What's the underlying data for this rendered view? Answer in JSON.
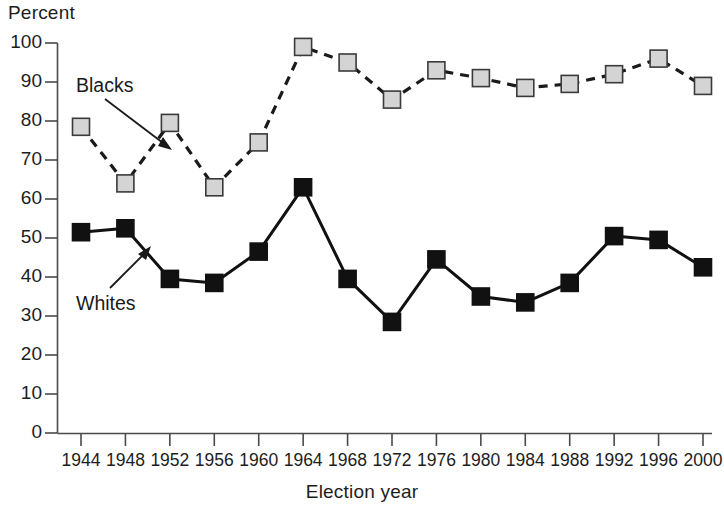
{
  "chart_data": {
    "type": "line",
    "title": "",
    "xlabel": "Election year",
    "ylabel": "Percent",
    "ylim": [
      0,
      100
    ],
    "y_ticks": [
      0,
      10,
      20,
      30,
      40,
      50,
      60,
      70,
      80,
      90,
      100
    ],
    "grid": false,
    "legend_position": "inline-annotations",
    "categories": [
      1944,
      1948,
      1952,
      1956,
      1960,
      1964,
      1968,
      1972,
      1976,
      1980,
      1984,
      1988,
      1992,
      1996,
      2000
    ],
    "x_tick_labels": [
      "1944",
      "1948",
      "1952",
      "1956",
      "1960",
      "1964",
      "1968",
      "1972",
      "1976",
      "1980",
      "1984",
      "1988",
      "1992",
      "1996",
      "2000"
    ],
    "series": [
      {
        "name": "Blacks",
        "marker": "square",
        "marker_fill": "#d4d4d4",
        "marker_edge": "#3a3a3a",
        "line_style": "dashed",
        "line_color": "#1a1a1a",
        "values": [
          78.5,
          64,
          79.5,
          63,
          74.5,
          99,
          95,
          85.5,
          93,
          91,
          88.5,
          89.5,
          92,
          96,
          89
        ]
      },
      {
        "name": "Whites",
        "marker": "square",
        "marker_fill": "#111111",
        "marker_edge": "#111111",
        "line_style": "solid",
        "line_color": "#111111",
        "values": [
          51.5,
          52.5,
          39.5,
          38.5,
          46.5,
          63,
          39.5,
          28.5,
          44.5,
          35,
          33.5,
          38.5,
          50.5,
          49.5,
          42.5
        ]
      }
    ],
    "annotations": [
      {
        "text": "Blacks",
        "points_to_series": "Blacks",
        "points_to_x": 1950
      },
      {
        "text": "Whites",
        "points_to_series": "Whites",
        "points_to_x": 1950
      }
    ],
    "axis_colors": {
      "axis_line": "#4a4a4a",
      "text": "#1d1d1d"
    }
  },
  "labels": {
    "y_axis_title": "Percent",
    "x_axis_title": "Election year",
    "series_blacks": "Blacks",
    "series_whites": "Whites"
  }
}
